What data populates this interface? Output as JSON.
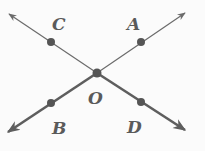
{
  "diagram": {
    "type": "intersecting-lines",
    "colors": {
      "line": "#6b6b6b",
      "bold_line": "#5e5e5e",
      "point": "#555555",
      "label": "#5a5a5a",
      "background": "#fbfbfb"
    },
    "center": {
      "label": "O",
      "x": 97,
      "y": 73
    },
    "points": [
      {
        "label": "C",
        "x": 51,
        "y": 42,
        "label_x": 58,
        "label_y": 30
      },
      {
        "label": "A",
        "x": 141,
        "y": 42,
        "label_x": 133,
        "label_y": 30
      },
      {
        "label": "B",
        "x": 51,
        "y": 103,
        "label_x": 59,
        "label_y": 133
      },
      {
        "label": "D",
        "x": 141,
        "y": 102,
        "label_x": 133,
        "label_y": 132
      }
    ],
    "rays": [
      {
        "name": "ray-OC",
        "to": [
          9,
          14
        ],
        "bold": false
      },
      {
        "name": "ray-OA",
        "to": [
          185,
          13
        ],
        "bold": false
      },
      {
        "name": "ray-OB",
        "to": [
          8,
          132
        ],
        "bold": true
      },
      {
        "name": "ray-OD",
        "to": [
          185,
          130
        ],
        "bold": true
      }
    ],
    "labels": {
      "C": "C",
      "A": "A",
      "O": "O",
      "B": "B",
      "D": "D"
    }
  }
}
